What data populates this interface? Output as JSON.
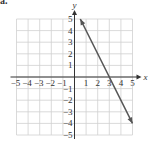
{
  "part_label": "a.",
  "chart_data": {
    "type": "line",
    "title": "",
    "xlabel": "x",
    "ylabel": "y",
    "xlim": [
      -5,
      5
    ],
    "ylim": [
      -5,
      5
    ],
    "grid": true,
    "x_ticks": [
      -5,
      -4,
      -3,
      -2,
      -1,
      1,
      2,
      3,
      4,
      5
    ],
    "y_ticks": [
      -5,
      -4,
      -3,
      -2,
      -1,
      1,
      2,
      3,
      4,
      5
    ],
    "x_tick_labels": [
      "−5",
      "−4",
      "−3",
      "−2",
      "−1",
      "1",
      "2",
      "3",
      "4",
      "5"
    ],
    "y_tick_labels": [
      "−5",
      "−4",
      "−3",
      "−2",
      "−1",
      "1",
      "2",
      "3",
      "4",
      "5"
    ],
    "series": [
      {
        "name": "y = -2x + 6",
        "equation": "y = -2x + 6",
        "x": [
          0.5,
          5
        ],
        "y": [
          5,
          -4
        ],
        "x_intercept": 3,
        "arrows_both_ends": true
      }
    ],
    "colors": {
      "grid": "#d0d0d0",
      "axis": "#333333",
      "line": "#555555",
      "text": "#333333"
    }
  }
}
